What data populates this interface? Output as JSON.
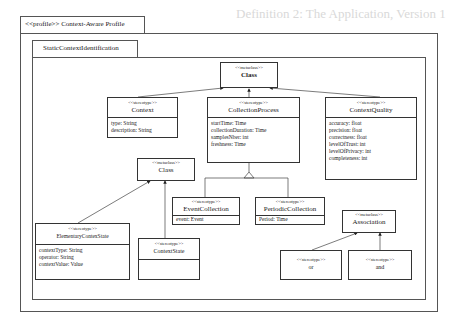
{
  "background_text": {
    "heading": "Definition 2: The Application, Version 1"
  },
  "profile": {
    "tab_label": "<<profile>> Context-Aware Profile"
  },
  "package": {
    "tab_label": "StaticContextIdentification"
  },
  "classes": {
    "class_top": {
      "stereotype": "<<metaclass>>",
      "name": "Class",
      "attributes": []
    },
    "context": {
      "stereotype": "<<stereotype>>",
      "name": "Context",
      "attributes": [
        "type: String",
        "description: String"
      ]
    },
    "collection_process": {
      "stereotype": "<<stereotype>>",
      "name": "CollectionProcess",
      "attributes": [
        "startTime: Time",
        "collectionDuration: Time",
        "samplesNber: int",
        "freshness: Time"
      ]
    },
    "context_quality": {
      "stereotype": "<<stereotype>>",
      "name": "ContextQuality",
      "attributes": [
        "accuracy: float",
        "precision: float",
        "correctness: float",
        "levelOfTrust: int",
        "levelOfPrivacy: int",
        "completeness: int"
      ]
    },
    "class_mid": {
      "stereotype": "<<metaclass>>",
      "name": "Class",
      "attributes": []
    },
    "event_collection": {
      "stereotype": "<<stereotype>>",
      "name": "EventCollection",
      "attributes": [
        "event: Event"
      ]
    },
    "periodic_collection": {
      "stereotype": "<<stereotype>>",
      "name": "PeriodicCollection",
      "attributes": [
        "Period: Time"
      ]
    },
    "association": {
      "stereotype": "<<metaclass>>",
      "name": "Association",
      "attributes": []
    },
    "elementary_contex_state": {
      "stereotype": "<<stereotype>>",
      "name": "ElementaryContexState",
      "attributes": [
        "contextType: String",
        "operator: String",
        "contextValue: Value"
      ]
    },
    "context_state": {
      "stereotype": "<<stereotype>>",
      "name": "ContextState",
      "attributes": []
    },
    "or": {
      "stereotype": "<<stereotype>>",
      "name": "or",
      "attributes": []
    },
    "and": {
      "stereotype": "<<stereotype>>",
      "name": "and",
      "attributes": []
    }
  },
  "relations": [
    {
      "from": "Context",
      "to": "Class (top)",
      "type": "extension"
    },
    {
      "from": "CollectionProcess",
      "to": "Class (top)",
      "type": "extension"
    },
    {
      "from": "ContextQuality",
      "to": "Class (top)",
      "type": "extension"
    },
    {
      "from": "EventCollection",
      "to": "CollectionProcess",
      "type": "generalization"
    },
    {
      "from": "PeriodicCollection",
      "to": "CollectionProcess",
      "type": "generalization"
    },
    {
      "from": "ElementaryContexState",
      "to": "Class (mid)",
      "type": "extension"
    },
    {
      "from": "ContextState",
      "to": "Class (mid)",
      "type": "extension"
    },
    {
      "from": "or",
      "to": "Association",
      "type": "extension"
    },
    {
      "from": "and",
      "to": "Association",
      "type": "extension"
    }
  ],
  "colors": {
    "line": "#333333",
    "frame": "#555555",
    "background": "#ffffff"
  }
}
